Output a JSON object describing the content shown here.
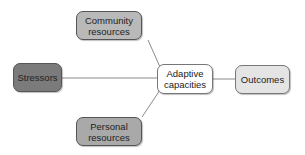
{
  "diagram": {
    "nodes": [
      {
        "id": "community",
        "label": "Community resources",
        "line1": "Community",
        "line2": "resources",
        "fill": "#b9b9b9"
      },
      {
        "id": "stressors",
        "label": "Stressors",
        "fill": "#7b7b7b"
      },
      {
        "id": "adaptive",
        "label": "Adaptive capacities",
        "line1": "Adaptive",
        "line2": "capacities",
        "fill": "#ffffff"
      },
      {
        "id": "outcomes",
        "label": "Outcomes",
        "fill": "#e4e4e4"
      },
      {
        "id": "personal",
        "label": "Personal resources",
        "line1": "Personal",
        "line2": "resources",
        "fill": "#a9a9a9"
      }
    ],
    "edges": [
      {
        "from": "community",
        "to": "adaptive"
      },
      {
        "from": "stressors",
        "to": "adaptive"
      },
      {
        "from": "personal",
        "to": "adaptive"
      },
      {
        "from": "adaptive",
        "to": "outcomes"
      }
    ],
    "edge_color": "#8a8a8a"
  }
}
